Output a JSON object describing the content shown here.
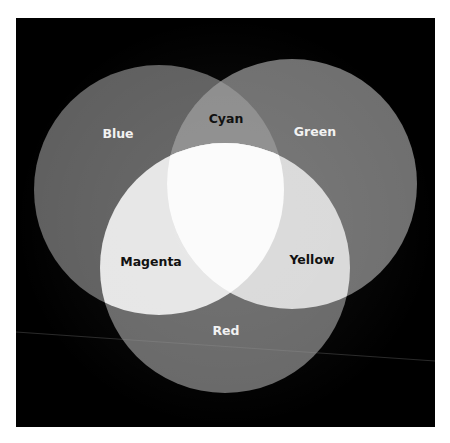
{
  "diagram": {
    "title": "",
    "type": "venn",
    "background": "#000000",
    "circles": [
      {
        "id": "blue",
        "label": "Blue",
        "cx": 159,
        "cy": 190,
        "r": 125,
        "fill": "#5f5f5f",
        "text_color": "#f2f2f2",
        "label_x": 118,
        "label_y": 138
      },
      {
        "id": "green",
        "label": "Green",
        "cx": 292,
        "cy": 184,
        "r": 125,
        "fill": "#6f6f6f",
        "text_color": "#f2f2f2",
        "label_x": 315,
        "label_y": 136
      },
      {
        "id": "red",
        "label": "Red",
        "cx": 225,
        "cy": 268,
        "r": 125,
        "fill": "#686868",
        "text_color": "#f2f2f2",
        "label_x": 226,
        "label_y": 335
      }
    ],
    "overlaps": [
      {
        "id": "cyan",
        "label": "Cyan",
        "sets": [
          "blue",
          "green"
        ],
        "fill": "#8c8c8c",
        "text_color": "#111111",
        "label_x": 226,
        "label_y": 123
      },
      {
        "id": "magenta",
        "label": "Magenta",
        "sets": [
          "blue",
          "red"
        ],
        "fill": "#e6e6e6",
        "text_color": "#111111",
        "label_x": 151,
        "label_y": 266
      },
      {
        "id": "yellow",
        "label": "Yellow",
        "sets": [
          "green",
          "red"
        ],
        "fill": "#d9d9d9",
        "text_color": "#111111",
        "label_x": 312,
        "label_y": 264
      },
      {
        "id": "white",
        "label": "",
        "sets": [
          "blue",
          "green",
          "red"
        ],
        "fill": "#fbfbfb"
      }
    ]
  }
}
